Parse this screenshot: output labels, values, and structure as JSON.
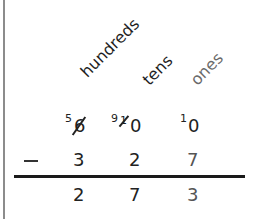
{
  "columns": {
    "hundreds": "hundreds",
    "tens": "tens",
    "ones": "ones"
  },
  "minuend": {
    "hundreds": {
      "original": "6",
      "regrouped": "5",
      "crossed_out": true
    },
    "tens": {
      "original": "0",
      "regrouped": "9",
      "crossed_mark": "1",
      "crossed_out": true
    },
    "ones": {
      "original": "0",
      "regrouped": "1",
      "crossed_out": false
    }
  },
  "operator": "−",
  "subtrahend": {
    "hundreds": "3",
    "tens": "2",
    "ones": "7"
  },
  "difference": {
    "hundreds": "2",
    "tens": "7",
    "ones": "3"
  },
  "colors": {
    "text": "#222222",
    "ones_header": "#6a6a6a",
    "left_border": "#8c8c8c",
    "rule": "#1a1a1a"
  }
}
